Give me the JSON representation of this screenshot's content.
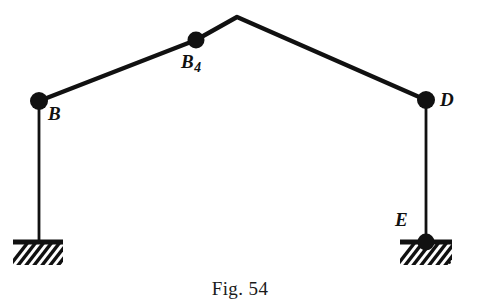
{
  "figure": {
    "caption": "Fig. 54",
    "background_color": "#ffffff",
    "ink_color": "#111111",
    "width": 480,
    "height": 308
  },
  "labels": {
    "b": {
      "text": "B",
      "subscript": ""
    },
    "b4": {
      "text": "B",
      "subscript": "4"
    },
    "d": {
      "text": "D",
      "subscript": ""
    },
    "e": {
      "text": "E",
      "subscript": ""
    }
  },
  "diagram_data": {
    "type": "line-diagram",
    "nodes": [
      {
        "id": "B",
        "label": "B",
        "x": 39,
        "y": 101,
        "marker": "filled-dot",
        "radius": 9,
        "label_dx": 9,
        "label_dy": 3
      },
      {
        "id": "B4",
        "label": "B4",
        "x": 196,
        "y": 40,
        "marker": "filled-dot",
        "radius": 8.5,
        "label_dx": -15,
        "label_dy": 12
      },
      {
        "id": "apex",
        "label": "",
        "x": 237,
        "y": 17,
        "marker": "none",
        "radius": 0,
        "label_dx": 0,
        "label_dy": 0
      },
      {
        "id": "D",
        "label": "D",
        "x": 426,
        "y": 100,
        "marker": "filled-dot",
        "radius": 9,
        "label_dx": 14,
        "label_dy": 2
      },
      {
        "id": "E",
        "label": "E",
        "x": 426,
        "y": 242,
        "marker": "filled-dot",
        "radius": 8.5,
        "label_dx": -31,
        "label_dy": -20
      }
    ],
    "links": [
      {
        "from": "B",
        "to": "B4",
        "stroke_width": 4.2
      },
      {
        "from": "B4",
        "to": "apex",
        "stroke_width": 4.2
      },
      {
        "from": "apex",
        "to": "D",
        "stroke_width": 4.2
      },
      {
        "from": "B",
        "to": "ground_left",
        "stroke_width": 2.6
      },
      {
        "from": "D",
        "to": "E",
        "stroke_width": 2.6
      }
    ],
    "supports": [
      {
        "id": "ground-left",
        "attached_to": "B",
        "type": "fixed-hatched-ground",
        "bar_x1": 13,
        "bar_x2": 63,
        "bar_y": 242,
        "bar_thickness": 5,
        "hatch_depth": 21,
        "hatch_count": 7,
        "hatch_angle_deg": 45
      },
      {
        "id": "ground-right",
        "attached_to": "E",
        "type": "fixed-hatched-ground",
        "bar_x1": 400,
        "bar_x2": 452,
        "bar_y": 242,
        "bar_thickness": 5,
        "hatch_depth": 21,
        "hatch_count": 7,
        "hatch_angle_deg": 45
      }
    ]
  }
}
